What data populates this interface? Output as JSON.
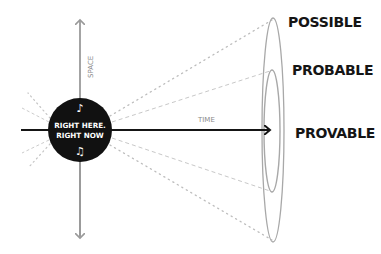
{
  "diagram": {
    "center": {
      "line1": "RIGHT HERE.",
      "line2": "RIGHT NOW",
      "note_top": "♪",
      "note_bottom": "♫"
    },
    "axes": {
      "vertical_label": "SPACE",
      "horizontal_label": "TIME"
    },
    "cones": [
      {
        "id": "possible",
        "label": "POSSIBLE"
      },
      {
        "id": "probable",
        "label": "PROBABLE"
      },
      {
        "id": "provable",
        "label": "PROVABLE"
      }
    ],
    "colors": {
      "ink": "#151515",
      "axis_gray": "#9a9a9a",
      "ellipse_gray": "#a8a8a8",
      "ray_gray": "#c4c4c4",
      "background": "#ffffff"
    }
  }
}
